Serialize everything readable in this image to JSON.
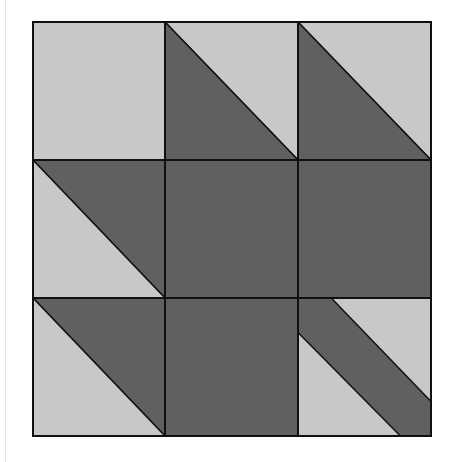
{
  "figure": {
    "type": "quilt-block",
    "grid": {
      "rows": 3,
      "cols": 3
    },
    "bounds": {
      "left": 33,
      "top": 22,
      "right": 431,
      "bottom": 436
    },
    "col_edges": [
      33,
      165,
      298,
      431
    ],
    "row_edges": [
      22,
      160,
      298,
      436
    ],
    "colors": {
      "light": "#c8c8c8",
      "dark": "#606060",
      "outline": "#111111",
      "background": "#ffffff"
    },
    "cells": [
      {
        "row": 0,
        "col": 0,
        "pattern": "solid-light"
      },
      {
        "row": 0,
        "col": 1,
        "pattern": "hst-dark-bottom-left"
      },
      {
        "row": 0,
        "col": 2,
        "pattern": "hst-dark-bottom-left"
      },
      {
        "row": 1,
        "col": 0,
        "pattern": "hst-dark-top-right"
      },
      {
        "row": 1,
        "col": 1,
        "pattern": "solid-dark"
      },
      {
        "row": 1,
        "col": 2,
        "pattern": "solid-dark"
      },
      {
        "row": 2,
        "col": 0,
        "pattern": "hst-dark-top-right"
      },
      {
        "row": 2,
        "col": 1,
        "pattern": "solid-dark"
      },
      {
        "row": 2,
        "col": 2,
        "pattern": "diagonal-dark-band"
      }
    ]
  }
}
